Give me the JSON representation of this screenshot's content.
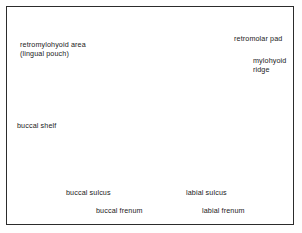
{
  "figure": {
    "border_color": "#2b2b2b",
    "background": "#ffffff"
  },
  "palette": {
    "outline": "#1c1c1c",
    "bone_light": "#ececec",
    "bone_mid": "#d2d2d2",
    "mucosa_gray": "#b2b2b2",
    "tooth_white": "#f4f4f4",
    "hatch_gray": "#c9c9c9",
    "label_text": "#1a1a1a"
  },
  "labels": [
    {
      "name": "retromylohyoid-area",
      "lines": [
        "retromylohyoid area",
        "(lingual pouch)"
      ],
      "leader": "polyline-right-down",
      "arrow": false
    },
    {
      "name": "retromolar-pad",
      "lines": [
        "retromolar pad"
      ],
      "leader": "horizontal-left",
      "arrow": true
    },
    {
      "name": "mylohyoid-ridge",
      "lines": [
        "mylohyoid",
        "ridge"
      ],
      "leader": "horizontal-left",
      "arrow": true
    },
    {
      "name": "buccal-shelf",
      "lines": [
        "buccal shelf"
      ],
      "leader": "horizontal-right-down",
      "arrow": true
    },
    {
      "name": "buccal-sulcus",
      "lines": [
        "buccal sulcus"
      ],
      "leader": "vertical-up",
      "arrow": false
    },
    {
      "name": "buccal-frenum",
      "lines": [
        "buccal frenum"
      ],
      "leader": "vertical-up",
      "arrow": false
    },
    {
      "name": "labial-sulcus",
      "lines": [
        "labial sulcus"
      ],
      "leader": "vertical-up",
      "arrow": true
    },
    {
      "name": "labial-frenum",
      "lines": [
        "labial frenum"
      ],
      "leader": "vertical-up",
      "arrow": false
    }
  ]
}
